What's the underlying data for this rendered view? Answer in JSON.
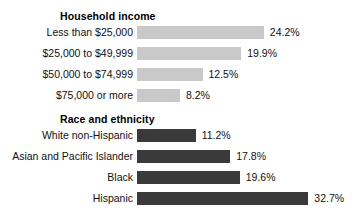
{
  "chart_data": {
    "type": "bar",
    "orientation": "horizontal",
    "title": "",
    "xlabel": "",
    "ylabel": "",
    "xlim": [
      0,
      32.7
    ],
    "grid": false,
    "legend": false,
    "value_suffix": "%",
    "panels": [
      {
        "heading": "Household income",
        "bar_color": "#c9c9c9",
        "categories": [
          "Less than $25,000",
          "$25,000 to $49,999",
          "$50,000 to $74,999",
          "$75,000 or more"
        ],
        "values": [
          24.2,
          19.9,
          12.5,
          8.2
        ],
        "value_labels": [
          "24.2%",
          "19.9%",
          "12.5%",
          "8.2%"
        ]
      },
      {
        "heading": "Race and ethnicity",
        "bar_color": "#3a3a3a",
        "categories": [
          "White non-Hispanic",
          "Asian and Pacific Islander",
          "Black",
          "Hispanic"
        ],
        "values": [
          11.2,
          17.8,
          19.6,
          32.7
        ],
        "value_labels": [
          "11.2%",
          "17.8%",
          "19.6%",
          "32.7%"
        ]
      }
    ]
  },
  "layout": {
    "bar_origin_x": 137,
    "px_per_unit": 5.24,
    "bar_height": 13,
    "row_pitch": 21,
    "panel_tops": [
      10,
      113
    ],
    "rows_offset": 16
  }
}
